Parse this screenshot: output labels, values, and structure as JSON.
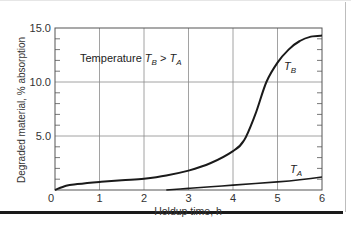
{
  "chart_data": {
    "type": "line",
    "title": "",
    "xlabel": "Holdup time, h",
    "ylabel": "Degraded material, % absorption",
    "xlim": [
      0,
      6
    ],
    "ylim": [
      0,
      15
    ],
    "x_ticks": [
      "0",
      "1",
      "2",
      "3",
      "4",
      "5",
      "6"
    ],
    "y_ticks": [
      "5.0",
      "10.0",
      "15.0"
    ],
    "grid": true,
    "annotation": "Temperature T_B > T_A",
    "series": [
      {
        "name": "T_B",
        "x": [
          0,
          0.25,
          0.5,
          1,
          1.5,
          2,
          2.5,
          3,
          3.5,
          4,
          4.25,
          4.5,
          4.75,
          5,
          5.25,
          5.5,
          5.75,
          6
        ],
        "y": [
          0,
          0.4,
          0.55,
          0.75,
          0.9,
          1.05,
          1.35,
          1.8,
          2.5,
          3.6,
          4.6,
          7.0,
          10.0,
          11.8,
          13.0,
          13.8,
          14.2,
          14.3
        ]
      },
      {
        "name": "T_A",
        "x": [
          2.5,
          3,
          3.5,
          4,
          4.5,
          5,
          5.5,
          6
        ],
        "y": [
          0,
          0.15,
          0.3,
          0.45,
          0.6,
          0.75,
          0.95,
          1.2
        ]
      }
    ]
  },
  "labels": {
    "annotation_prefix": "Temperature ",
    "series_b": "T",
    "series_b_sub": "B",
    "series_a": "T",
    "series_a_sub": "A",
    "gt": " > ",
    "x_axis": "Holdup time, h",
    "y_axis": "Degraded material, % absorption",
    "x0": "0",
    "x1": "1",
    "x2": "2",
    "x3": "3",
    "x4": "4",
    "x5": "5",
    "x6": "6",
    "y5": "5.0",
    "y10": "10.0",
    "y15": "15.0"
  }
}
